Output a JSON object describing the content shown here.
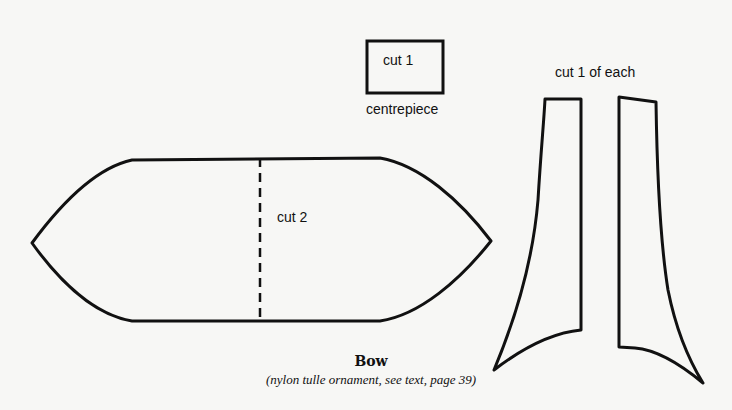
{
  "pieces": {
    "centrepiece": {
      "instruction": "cut 1",
      "label": "centrepiece"
    },
    "bow": {
      "instruction": "cut 2"
    },
    "tails": {
      "instruction": "cut 1 of each"
    }
  },
  "figure": {
    "title": "Bow",
    "caption": "(nylon tulle ornament, see text, page 39)"
  },
  "colors": {
    "line": "#111111",
    "paper": "#f7f7f5"
  }
}
